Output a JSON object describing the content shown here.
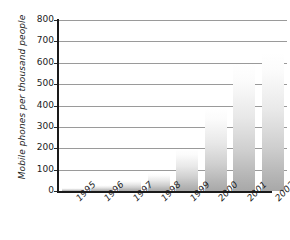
{
  "chart_data": {
    "type": "bar",
    "title": "",
    "xlabel": "",
    "ylabel": "Mobile phones per thousand people",
    "categories": [
      "1995",
      "1996",
      "1997",
      "1998",
      "1999",
      "2000",
      "2001",
      "2002"
    ],
    "values": [
      15,
      30,
      50,
      85,
      195,
      390,
      595,
      645
    ],
    "ylim": [
      0,
      800
    ],
    "ytick_step": 100,
    "yticks": [
      "0",
      "100",
      "200",
      "300",
      "400",
      "500",
      "600",
      "700",
      "800"
    ],
    "grid": true,
    "legend": null,
    "legend_position": "none",
    "series": [
      {
        "name": "Mobile phones per thousand people",
        "values": [
          15,
          30,
          50,
          85,
          195,
          390,
          595,
          645
        ]
      }
    ],
    "style": {
      "bar_gradient_top": "#ffffff",
      "bar_gradient_bottom": "#a8a8a8",
      "gridline_color": "#9a9a9a",
      "axis_color": "#1a1a1a",
      "text_color": "#1c1c1c",
      "background": "#ffffff"
    }
  }
}
